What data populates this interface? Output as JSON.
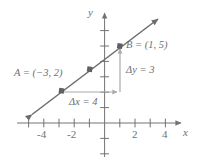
{
  "figure": {
    "type": "coordinate-plane-line-graph",
    "axes": {
      "x_label": "x",
      "y_label": "y",
      "x_ticks": [
        -5,
        -4,
        -3,
        -2,
        -1,
        1,
        2,
        3,
        4,
        5
      ],
      "x_tick_labels": [
        "-4",
        "-2",
        "2",
        "4"
      ],
      "x_tick_label_values": [
        -4,
        -2,
        2,
        4
      ],
      "y_ticks": [
        -2,
        -1,
        1,
        2,
        3,
        4,
        5,
        6
      ],
      "y_tick_labels": [],
      "origin": [
        0,
        0
      ],
      "xlim": [
        -5.8,
        5.4
      ],
      "ylim": [
        -2.6,
        6.6
      ]
    },
    "points": [
      {
        "name": "A",
        "label": "A = (−3, 2)",
        "x": -3,
        "y": 2,
        "marked": true
      },
      {
        "name": "M",
        "label": "",
        "x": -1,
        "y": 3.5,
        "marked": true
      },
      {
        "name": "B",
        "label": "B = (1, 5)",
        "x": 1,
        "y": 5,
        "marked": true
      }
    ],
    "line": {
      "slope": 0.75,
      "intercept": 4.25,
      "double_arrow": true
    },
    "annotations": [
      {
        "name": "delta-x",
        "label": "Δx = 4",
        "value": 4,
        "from": [
          -3,
          2
        ],
        "to": [
          1,
          2
        ],
        "direction": "horizontal"
      },
      {
        "name": "delta-y",
        "label": "Δy = 3",
        "value": 3,
        "from": [
          1,
          2
        ],
        "to": [
          1,
          5
        ],
        "direction": "vertical"
      }
    ],
    "colors": {
      "axis": "#737377",
      "line": "#6b6b70",
      "point": "#5f5f64",
      "annotation": "#a9a9ae",
      "text": "#6f6f73"
    }
  }
}
